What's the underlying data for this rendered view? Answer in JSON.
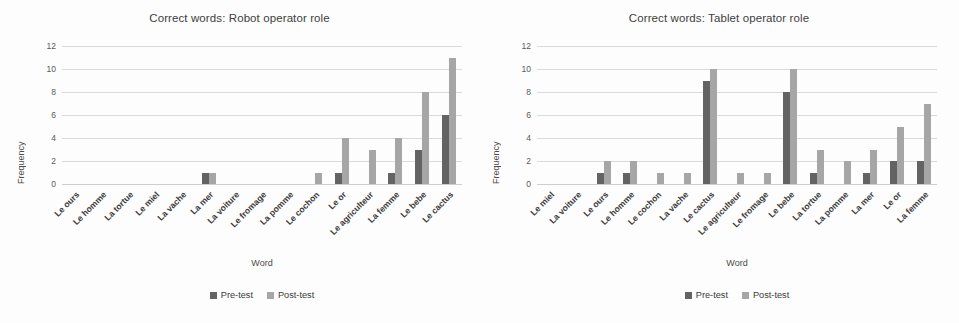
{
  "axis": {
    "ylabel": "Frequency",
    "xlabel": "Word",
    "yticks": [
      "12",
      "10",
      "8",
      "6",
      "4",
      "2",
      "0"
    ]
  },
  "legend": {
    "pre_label": "Pre-test",
    "post_label": "Post-test",
    "pre_color": "#636363",
    "post_color": "#a6a6a6"
  },
  "charts": [
    {
      "title": "Correct words: Robot operator role"
    },
    {
      "title": "Correct words: Tablet operator role"
    }
  ],
  "chart_data": [
    {
      "type": "bar",
      "title": "Correct words: Robot operator role",
      "xlabel": "Word",
      "ylabel": "Frequency",
      "ylim": [
        0,
        12
      ],
      "ytick_step": 2,
      "grid": true,
      "legend_position": "bottom",
      "categories": [
        "Le ours",
        "Le homme",
        "La tortue",
        "Le miel",
        "La vache",
        "La mer",
        "La voiture",
        "Le fromage",
        "La pomme",
        "Le cochon",
        "Le or",
        "Le agriculteur",
        "La femme",
        "Le bebe",
        "Le cactus"
      ],
      "series": [
        {
          "name": "Pre-test",
          "values": [
            0,
            0,
            0,
            0,
            0,
            1,
            0,
            0,
            0,
            0,
            1,
            0,
            1,
            3,
            6
          ]
        },
        {
          "name": "Post-test",
          "values": [
            0,
            0,
            0,
            0,
            0,
            1,
            0,
            0,
            0,
            1,
            4,
            3,
            4,
            8,
            11
          ]
        }
      ]
    },
    {
      "type": "bar",
      "title": "Correct words: Tablet operator role",
      "xlabel": "Word",
      "ylabel": "Frequency",
      "ylim": [
        0,
        12
      ],
      "ytick_step": 2,
      "grid": true,
      "legend_position": "bottom",
      "categories": [
        "Le miel",
        "La voiture",
        "Le ours",
        "Le homme",
        "Le cochon",
        "La vache",
        "Le cactus",
        "Le agriculteur",
        "Le fromage",
        "Le bebe",
        "La tortue",
        "La pomme",
        "La mer",
        "Le or",
        "La femme"
      ],
      "series": [
        {
          "name": "Pre-test",
          "values": [
            0,
            0,
            1,
            1,
            0,
            0,
            9,
            0,
            0,
            8,
            1,
            0,
            1,
            2,
            2
          ]
        },
        {
          "name": "Post-test",
          "values": [
            0,
            0,
            2,
            2,
            1,
            1,
            10,
            1,
            1,
            10,
            3,
            2,
            3,
            5,
            7
          ]
        }
      ]
    }
  ]
}
